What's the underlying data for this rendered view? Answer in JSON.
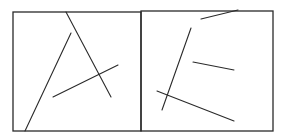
{
  "figure": {
    "width": 285,
    "height": 137,
    "stroke_color": "#2a2a2a",
    "background": "#ffffff",
    "panels": [
      {
        "id": "left",
        "frame": {
          "x": 13,
          "y": 12,
          "w": 128,
          "h": 119
        },
        "lines": [
          {
            "x1": 66,
            "y1": 12,
            "x2": 111,
            "y2": 97
          },
          {
            "x1": 71,
            "y1": 33,
            "x2": 25,
            "y2": 131
          },
          {
            "x1": 53,
            "y1": 97,
            "x2": 118,
            "y2": 65
          }
        ]
      },
      {
        "id": "right",
        "frame": {
          "x": 141,
          "y": 11,
          "w": 132,
          "h": 120
        },
        "lines": [
          {
            "x1": 201,
            "y1": 19,
            "x2": 238,
            "y2": 10
          },
          {
            "x1": 191,
            "y1": 28,
            "x2": 162,
            "y2": 110
          },
          {
            "x1": 193,
            "y1": 62,
            "x2": 234,
            "y2": 70
          },
          {
            "x1": 157,
            "y1": 91,
            "x2": 234,
            "y2": 121
          }
        ]
      }
    ]
  }
}
